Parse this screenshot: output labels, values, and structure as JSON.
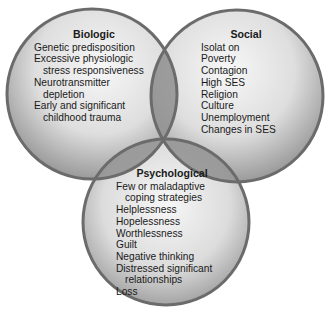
{
  "diagram": {
    "type": "venn",
    "colors": {
      "circle_fill_light": "#f4f4f4",
      "circle_fill_dark": "#9a9a9a",
      "circle_stroke": "#6e6e6e",
      "overlap_fill": "#8c8c8c"
    },
    "circles": [
      {
        "id": "biologic",
        "title": "Biologic",
        "lines": [
          {
            "text": "Genetic predisposition",
            "indent": false
          },
          {
            "text": "Excessive physiologic",
            "indent": false
          },
          {
            "text": "stress responsiveness",
            "indent": true
          },
          {
            "text": "Neurotransmitter",
            "indent": false
          },
          {
            "text": "depletion",
            "indent": true
          },
          {
            "text": "Early and significant",
            "indent": false
          },
          {
            "text": "childhood trauma",
            "indent": true
          }
        ]
      },
      {
        "id": "social",
        "title": "Social",
        "lines": [
          {
            "text": "Isolat on",
            "indent": false
          },
          {
            "text": "Poverty",
            "indent": false
          },
          {
            "text": "Contagion",
            "indent": false
          },
          {
            "text": "High SES",
            "indent": false
          },
          {
            "text": "Religion",
            "indent": false
          },
          {
            "text": "Culture",
            "indent": false
          },
          {
            "text": "Unemployment",
            "indent": false
          },
          {
            "text": "Changes in SES",
            "indent": false
          }
        ]
      },
      {
        "id": "psychological",
        "title": "Psychological",
        "lines": [
          {
            "text": "Few or maladaptive",
            "indent": false
          },
          {
            "text": "coping strategies",
            "indent": true
          },
          {
            "text": "Helplessness",
            "indent": false
          },
          {
            "text": "Hopelessness",
            "indent": false
          },
          {
            "text": "Worthlessness",
            "indent": false
          },
          {
            "text": "Guilt",
            "indent": false
          },
          {
            "text": "Negative thinking",
            "indent": false
          },
          {
            "text": "Distressed significant",
            "indent": false
          },
          {
            "text": "relationships",
            "indent": true
          },
          {
            "text": "Loss",
            "indent": false
          }
        ]
      }
    ]
  }
}
